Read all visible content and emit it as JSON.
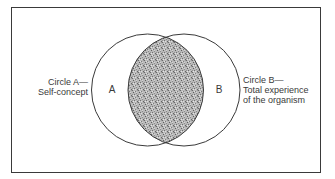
{
  "diagram": {
    "type": "venn",
    "title": "",
    "colors": {
      "stroke": "#3a3a3a",
      "shading": "#a8a8a8",
      "background": "#ffffff"
    },
    "circles": [
      {
        "id": "A",
        "region_label": "A",
        "label_lines": [
          "Circle A—",
          "Self-concept"
        ],
        "cx": 147.5,
        "cy": 90,
        "r": 56
      },
      {
        "id": "B",
        "region_label": "B",
        "label_lines": [
          "Circle B—",
          "Total experience",
          "of the organism"
        ],
        "cx": 184,
        "cy": 90,
        "r": 56
      }
    ],
    "intersection": {
      "shaded": true,
      "pattern": "stipple"
    }
  }
}
